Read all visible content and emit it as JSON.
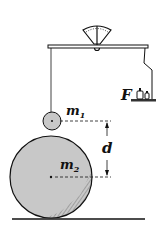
{
  "diagram": {
    "labels": {
      "mass1": "m",
      "mass1_sub": "1",
      "mass2": "m",
      "mass2_sub": "2",
      "distance": "d",
      "force": "F"
    },
    "colors": {
      "ink": "#111111",
      "sphere_fill": "#c8c8c8",
      "background": "#ffffff"
    }
  }
}
